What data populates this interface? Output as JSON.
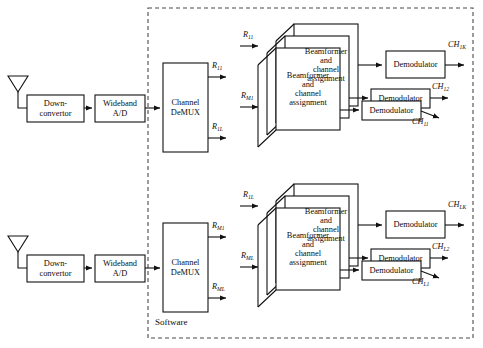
{
  "diagram": {
    "boundary_label": "Software",
    "line_color": "#111111",
    "dash_color": "#4a4a4a",
    "background": "#ffffff"
  },
  "chains": [
    {
      "id": "chain-top",
      "antenna": "antenna-1",
      "downconvertor": "Down-\nconvertor",
      "downconvertor_l1": "Down-",
      "downconvertor_l2": "convertor",
      "adc_l1": "Wideband",
      "adc_l2": "A/D",
      "demux_l1": "Channel",
      "demux_l2": "DeMUX",
      "demux_outputs": [
        {
          "base": "R",
          "sub": "11"
        },
        {
          "base": "R",
          "sub": "1L"
        }
      ],
      "beamformer_inputs": [
        {
          "base": "R",
          "sub": "11"
        },
        {
          "base": "R",
          "sub": "M1"
        }
      ],
      "beamformer_l1": "Beamformer",
      "beamformer_l2": "and",
      "beamformer_l3": "channel",
      "beamformer_l4": "assignment",
      "beamformer_stack": 3,
      "demodulator_label": "Demodulator",
      "demodulator_stack_top": 1,
      "demodulator_stack_bottom": 2,
      "channel_outputs": [
        {
          "base": "CH",
          "sub": "1K"
        },
        {
          "base": "CH",
          "sub": "12"
        },
        {
          "base": "CH",
          "sub": "11"
        }
      ]
    },
    {
      "id": "chain-bottom",
      "antenna": "antenna-2",
      "downconvertor_l1": "Down-",
      "downconvertor_l2": "convertor",
      "adc_l1": "Wideband",
      "adc_l2": "A/D",
      "demux_l1": "Channel",
      "demux_l2": "DeMUX",
      "demux_outputs": [
        {
          "base": "R",
          "sub": "M1"
        },
        {
          "base": "R",
          "sub": "ML"
        }
      ],
      "beamformer_inputs": [
        {
          "base": "R",
          "sub": "1L"
        },
        {
          "base": "R",
          "sub": "ML"
        }
      ],
      "beamformer_l1": "Beamformer",
      "beamformer_l2": "and",
      "beamformer_l3": "channel",
      "beamformer_l4": "assignment",
      "beamformer_stack": 3,
      "demodulator_label": "Demodulator",
      "channel_outputs": [
        {
          "base": "CH",
          "sub": "LK"
        },
        {
          "base": "CH",
          "sub": "L2"
        },
        {
          "base": "CH",
          "sub": "L1"
        }
      ]
    }
  ],
  "extra_labels": {
    "top_bf_back_l1": "Beamformer",
    "top_bf_back_l2": "and",
    "top_bf_back_l3": "channel",
    "top_bf_back_l4": "assignment",
    "mid_marker_top": "R",
    "mid_marker_top_sub": "1L",
    "mid_marker_bottom": "R",
    "mid_marker_bottom_sub": "M1"
  }
}
